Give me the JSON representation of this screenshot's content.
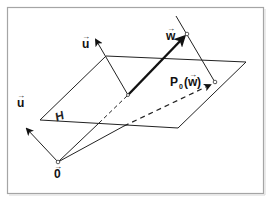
{
  "diagram": {
    "frame": {
      "x": 7,
      "y": 7,
      "w": 257,
      "h": 187,
      "stroke": "#9a9a9a"
    },
    "plane": {
      "label": "H",
      "points": [
        [
          40,
          120
        ],
        [
          106,
          56
        ],
        [
          246,
          62
        ],
        [
          178,
          128
        ]
      ]
    },
    "origin": {
      "label": "0",
      "x": 58,
      "y": 162
    },
    "base_point": {
      "x": 128,
      "y": 95
    },
    "vectors": [
      {
        "name": "u",
        "label": "u",
        "from": [
          58,
          162
        ],
        "to": [
          26,
          128
        ]
      },
      {
        "name": "u-translated",
        "label": "u",
        "from": [
          128,
          95
        ],
        "to": [
          95,
          38
        ]
      },
      {
        "name": "w",
        "label": "w",
        "from": [
          128,
          95
        ],
        "to": [
          186,
          34
        ]
      }
    ],
    "projection": {
      "label_main": "P",
      "label_sub": "0",
      "label_arg": "(w)",
      "point": [
        215,
        82
      ],
      "line_from": [
        176,
        16
      ],
      "line_to": [
        216,
        84
      ]
    },
    "labels": {
      "u_left": "u",
      "u_top": "u",
      "w": "w",
      "origin": "0",
      "plane": "H",
      "proj_P": "P",
      "proj_sub": "0",
      "proj_open": "(",
      "proj_w": "w",
      "proj_close": ")",
      "arrow_glyph": "→"
    }
  }
}
